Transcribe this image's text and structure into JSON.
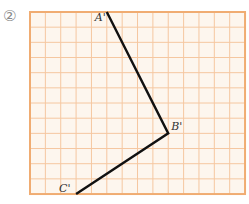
{
  "problem_label": "②",
  "grid": {
    "columns": 14,
    "rows": 12,
    "origin_px": [
      30,
      12
    ],
    "cell_w": 15.36,
    "cell_h": 15.17,
    "background": "#fdf6ee",
    "line_color": "#f5c7a0",
    "border_color": "#f0ac72"
  },
  "polyline": {
    "color": "#111111",
    "points": [
      {
        "name": "A'",
        "col": 5,
        "row": 0,
        "label_dx": -12,
        "label_dy": 9
      },
      {
        "name": "B'",
        "col": 9,
        "row": 8,
        "label_dx": 3,
        "label_dy": -3
      },
      {
        "name": "C'",
        "col": 3,
        "row": 12,
        "label_dx": -17,
        "label_dy": -2
      }
    ]
  }
}
